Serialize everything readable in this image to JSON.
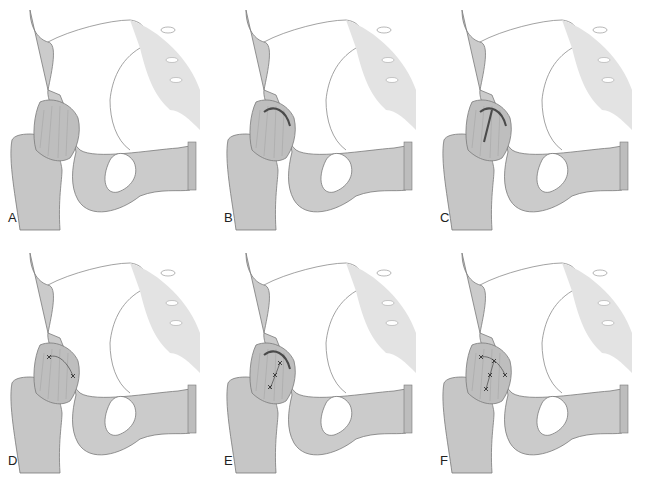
{
  "figure": {
    "panels": [
      {
        "id": "A",
        "label": "A",
        "capsule_state": "intact capsule"
      },
      {
        "id": "B",
        "label": "B",
        "capsule_state": "transverse capsulotomy along acetabular rim"
      },
      {
        "id": "C",
        "label": "C",
        "capsule_state": "T-shaped capsulotomy"
      },
      {
        "id": "D",
        "label": "D",
        "capsule_state": "transverse capsulotomy repaired with 2 sutures"
      },
      {
        "id": "E",
        "label": "E",
        "capsule_state": "longitudinal limb repaired with 3 sutures, transverse limb open"
      },
      {
        "id": "F",
        "label": "F",
        "capsule_state": "full T-capsulotomy repaired with multiple sutures"
      }
    ]
  },
  "colors": {
    "background": "#ffffff",
    "bone": "#c9c9c9",
    "bone_light": "#dedede",
    "bone_shadow": "#a8a8a8",
    "outline": "#7a7a7a",
    "capsule": "#bdbdbd",
    "incision": "#4a4a4a",
    "label": "#222222"
  }
}
